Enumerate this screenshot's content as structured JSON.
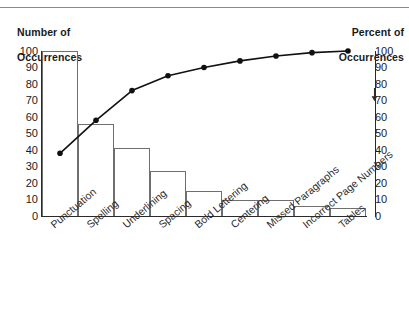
{
  "chart_data": {
    "type": "bar",
    "title": "",
    "subtitle": "",
    "categories": [
      "Punctuation",
      "Spelling",
      "Underlining",
      "Spacing",
      "Bold Lettering",
      "Centering",
      "Missed Paragraphs",
      "Incorrect Page Numbers",
      "Tables"
    ],
    "series": [
      {
        "name": "Number of Occurrences",
        "type": "bar",
        "values": [
          100,
          56,
          41,
          27,
          15,
          10,
          10,
          6,
          5
        ],
        "axis": "left"
      },
      {
        "name": "Percent of Occurrences",
        "type": "line",
        "values": [
          38,
          58,
          76,
          85,
          90,
          94,
          97,
          99,
          100
        ],
        "axis": "right"
      }
    ],
    "left_axis": {
      "label": "Number of\nOccurrences",
      "label_line1": "Number of",
      "label_line2": "Occurrences",
      "ticks": [
        "100",
        "90",
        "80",
        "70",
        "60",
        "50",
        "40",
        "30",
        "20",
        "10",
        "0"
      ],
      "min": 0,
      "max": 100
    },
    "right_axis": {
      "label": "Percent of\nOccurrences",
      "label_line1": "Percent of",
      "label_line2": "Occurrences",
      "ticks": [
        "100",
        "90",
        "80",
        "70",
        "60",
        "50",
        "40",
        "30",
        "20",
        "10",
        "0"
      ],
      "min": 0,
      "max": 100,
      "marker": "down-arrow"
    },
    "xlabel": "",
    "ylabel": "Number of Occurrences",
    "grid": false,
    "legend": "none",
    "colors": {
      "bar_stroke": "#6f6f6f",
      "line": "#111111",
      "axis": "#2a2a2a",
      "text": "#1a1a1a",
      "background": "#ffffff",
      "top_rule": "#8a8a8a"
    }
  }
}
